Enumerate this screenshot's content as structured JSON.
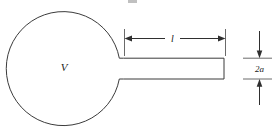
{
  "figure": {
    "kind": "line-diagram",
    "background_color": "#ffffff",
    "line_color": "#3b3b3b",
    "dimension_color": "#2f2f2f",
    "labels": {
      "volume": "V",
      "length": "l",
      "diameter": "2a"
    },
    "geometry": {
      "cavity": {
        "shape": "circle",
        "center_x": 66,
        "center_y": 77,
        "radius": 57
      },
      "neck": {
        "shape": "rectangle",
        "left_x": 122,
        "right_x": 224,
        "top_y": 58,
        "bottom_y": 79
      },
      "length_dimension": {
        "y": 38,
        "start_x": 124,
        "end_x": 226
      },
      "diameter_dimension": {
        "x": 259,
        "top_y": 31,
        "bottom_y": 88
      }
    }
  }
}
